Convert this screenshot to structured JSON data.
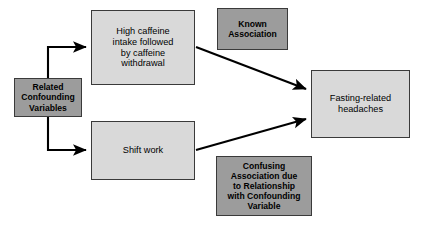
{
  "diagram": {
    "colors": {
      "light_box_fill": "#d9d9d9",
      "dark_box_fill": "#9c9c9c",
      "box_border": "#3a3a3a",
      "arrow": "#000000",
      "background": "#ffffff",
      "text": "#000000"
    },
    "nodes": [
      {
        "id": "related-confounding-variables",
        "label": "Related\nConfounding\nVariables",
        "style": "dark"
      },
      {
        "id": "high-caffeine-intake",
        "label": "High caffeine\nintake followed\nby caffeine\nwithdrawal",
        "style": "light"
      },
      {
        "id": "shift-work",
        "label": "Shift work",
        "style": "light"
      },
      {
        "id": "known-association",
        "label": "Known\nAssociation",
        "style": "dark"
      },
      {
        "id": "fasting-related-headaches",
        "label": "Fasting-related\nheadaches",
        "style": "light"
      },
      {
        "id": "confusing-association",
        "label": "Confusing\nAssociation due\nto Relationship\nwith Confounding\nVariable",
        "style": "dark"
      }
    ],
    "edges": [
      {
        "id": "edge-variables-to-caffeine",
        "from": "related-confounding-variables",
        "to": "high-caffeine-intake",
        "kind": "elbow-up"
      },
      {
        "id": "edge-variables-to-shift-work",
        "from": "related-confounding-variables",
        "to": "shift-work",
        "kind": "elbow-down"
      },
      {
        "id": "edge-caffeine-to-headaches",
        "from": "high-caffeine-intake",
        "to": "fasting-related-headaches",
        "kind": "diagonal-down"
      },
      {
        "id": "edge-shift-work-to-headaches",
        "from": "shift-work",
        "to": "fasting-related-headaches",
        "kind": "diagonal-up"
      }
    ]
  }
}
